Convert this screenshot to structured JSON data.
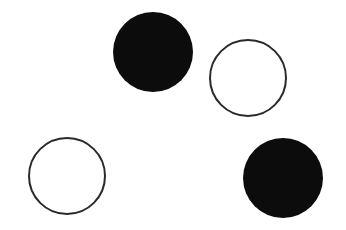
{
  "diagram": {
    "background": "#ffffff",
    "stroke_color": "#2a2a2a",
    "fill_color": "#0c0c0c",
    "circles": [
      {
        "id": "filled-top",
        "cx": 153,
        "cy": 52,
        "r": 40,
        "filled": true
      },
      {
        "id": "outline-top-right",
        "cx": 248,
        "cy": 78,
        "r": 39,
        "filled": false
      },
      {
        "id": "outline-bottom-left",
        "cx": 67,
        "cy": 176,
        "r": 39,
        "filled": false
      },
      {
        "id": "filled-bottom-right",
        "cx": 283,
        "cy": 178,
        "r": 40,
        "filled": true
      }
    ]
  }
}
